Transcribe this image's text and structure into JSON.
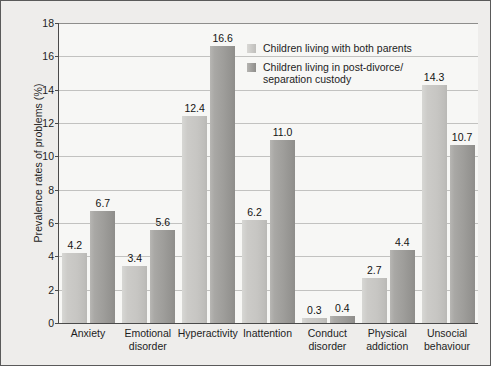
{
  "chart_data": {
    "type": "bar",
    "title": "",
    "xlabel": "",
    "ylabel": "Prevalence rates of problems (%)",
    "ylim": [
      0,
      18
    ],
    "ytick_step": 2,
    "yticks": [
      "0",
      "2",
      "4",
      "6",
      "8",
      "10",
      "12",
      "14",
      "16",
      "18"
    ],
    "grid": true,
    "legend_position": "top-right",
    "categories": [
      "Anxiety",
      "Emotional disorder",
      "Hyperactivity",
      "Inattention",
      "Conduct disorder",
      "Physical addiction",
      "Unsocial behaviour"
    ],
    "category_lines": [
      [
        "Anxiety"
      ],
      [
        "Emotional",
        "disorder"
      ],
      [
        "Hyperactivity"
      ],
      [
        "Inattention"
      ],
      [
        "Conduct",
        "disorder"
      ],
      [
        "Physical",
        "addiction"
      ],
      [
        "Unsocial",
        "behaviour"
      ]
    ],
    "series": [
      {
        "name": "Children living with both parents",
        "name_lines": [
          "Children living with both parents"
        ],
        "color": "#c9c8c5",
        "values": [
          4.2,
          3.4,
          12.4,
          6.2,
          0.3,
          2.7,
          14.3
        ],
        "value_labels": [
          "4.2",
          "3.4",
          "12.4",
          "6.2",
          "0.3",
          "2.7",
          "14.3"
        ]
      },
      {
        "name": "Children living in post-divorce/separation custody",
        "name_lines": [
          "Children living in post-divorce/",
          "separation custody"
        ],
        "color": "#9d9c99",
        "values": [
          6.7,
          5.6,
          16.6,
          11.0,
          0.4,
          4.4,
          10.7
        ],
        "value_labels": [
          "6.7",
          "5.6",
          "16.6",
          "11.0",
          "0.4",
          "4.4",
          "10.7"
        ]
      }
    ]
  }
}
